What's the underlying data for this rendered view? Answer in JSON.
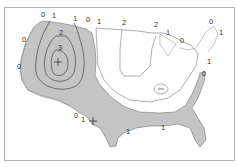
{
  "map": {
    "subject": "United States contour map",
    "colors": {
      "shaded": "#c4c4c4",
      "contour": "#555555",
      "frame": "#b5b5b5",
      "background": "#ffffff"
    },
    "markers": [
      {
        "type": "plus",
        "x": 58,
        "y": 62,
        "label": "maximum"
      },
      {
        "type": "plus",
        "x": 93,
        "y": 121,
        "label": "local"
      }
    ],
    "minus_marker": {
      "type": "minus",
      "x": 161,
      "y": 89
    },
    "labels": [
      {
        "text": "0",
        "x": 41,
        "y": 17
      },
      {
        "text": "1",
        "x": 52,
        "y": 18
      },
      {
        "text": "1",
        "x": 73,
        "y": 21
      },
      {
        "text": "0",
        "x": 86,
        "y": 22
      },
      {
        "text": "1",
        "x": 97,
        "y": 24
      },
      {
        "text": "2",
        "x": 122,
        "y": 25
      },
      {
        "text": "2",
        "x": 154,
        "y": 27
      },
      {
        "text": "1",
        "x": 166,
        "y": 35
      },
      {
        "text": "0",
        "x": 180,
        "y": 43
      },
      {
        "text": "0",
        "x": 209,
        "y": 24
      },
      {
        "text": "1",
        "x": 219,
        "y": 35
      },
      {
        "text": "0",
        "x": 22,
        "y": 42
      },
      {
        "text": "2",
        "x": 59,
        "y": 35
      },
      {
        "text": "3",
        "x": 58,
        "y": 50
      },
      {
        "text": "0",
        "x": 17,
        "y": 69
      },
      {
        "text": "1",
        "x": 207,
        "y": 64
      },
      {
        "text": "0",
        "x": 202,
        "y": 76
      },
      {
        "text": "0",
        "x": 74,
        "y": 118
      },
      {
        "text": "1",
        "x": 81,
        "y": 122
      },
      {
        "text": "1",
        "x": 126,
        "y": 134
      },
      {
        "text": "1",
        "x": 161,
        "y": 130
      }
    ]
  }
}
